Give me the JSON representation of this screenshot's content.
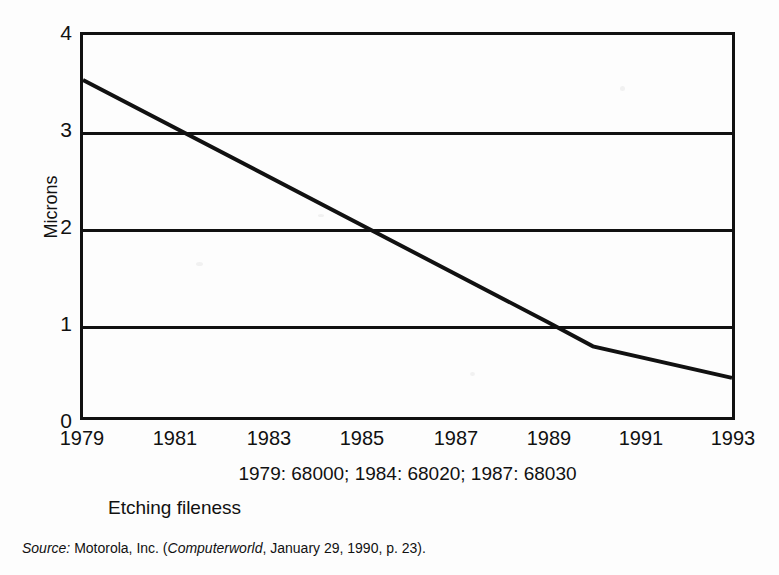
{
  "chart_data": {
    "type": "line",
    "title": "",
    "caption": "Etching fileness",
    "annotation": "1979: 68000; 1984: 68020; 1987: 68030",
    "xlabel": "",
    "ylabel": "Microns",
    "x": [
      1979,
      1981,
      1983,
      1985,
      1987,
      1989,
      1990,
      1993
    ],
    "values": [
      3.53,
      2.93,
      2.47,
      2.0,
      1.5,
      1.0,
      0.74,
      0.41
    ],
    "xlim": [
      1979,
      1993
    ],
    "ylim": [
      0,
      4
    ],
    "xticks": [
      "1979",
      "1981",
      "1983",
      "1985",
      "1987",
      "1989",
      "1991",
      "1993"
    ],
    "xtick_values": [
      1979,
      1981,
      1983,
      1985,
      1987,
      1989,
      1991,
      1993
    ],
    "yticks": [
      "0",
      "1",
      "2",
      "3",
      "4"
    ],
    "ytick_values": [
      0,
      1,
      2,
      3,
      4
    ],
    "gridlines": [
      1,
      2,
      3
    ],
    "grid": true,
    "legend": "none",
    "series": [
      {
        "name": "Etching fileness",
        "points": [
          {
            "year": 1979,
            "microns": 3.53
          },
          {
            "year": 1989,
            "microns": 1.0
          },
          {
            "year": 1990,
            "microns": 0.74
          },
          {
            "year": 1993,
            "microns": 0.41
          }
        ]
      }
    ],
    "line_color": "#111111",
    "axis_color": "#111111",
    "background": "#ffffff"
  },
  "source": {
    "label": "Source:",
    "publisher": "Motorola, Inc. (",
    "publication": "Computerworld",
    "rest": ", January 29, 1990, p. 23)."
  }
}
